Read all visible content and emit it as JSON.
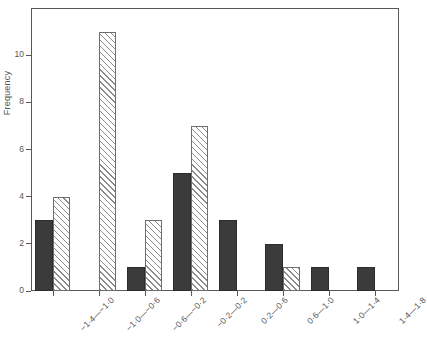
{
  "chart_data": {
    "type": "bar",
    "title": "",
    "subtitle": "",
    "xlabel": "",
    "ylabel": "Frequency",
    "grid": false,
    "legend": "none",
    "ylim": [
      0,
      12
    ],
    "yticks": [
      0,
      2,
      4,
      6,
      8,
      10
    ],
    "ytick_labels": [
      "0",
      "2",
      "4",
      "6",
      "8",
      "10"
    ],
    "categories": [
      "−1·4—−1·0",
      "−1·0—−0·6",
      "−0·6—−0·2",
      "−0·2—0·2",
      "0·2—0·6",
      "0·6—1·0",
      "1·0—1·4",
      "1·4—1·8"
    ],
    "series": [
      {
        "name": "solid",
        "fill": "solid-dark",
        "values": [
          3,
          0,
          1,
          5,
          3,
          2,
          1,
          1
        ]
      },
      {
        "name": "hatched",
        "fill": "diagonal-hatch",
        "values": [
          4,
          11,
          3,
          7,
          0,
          1,
          0,
          0
        ]
      }
    ],
    "colors": {
      "solid": "#3b3b3b",
      "hatch_line": "#8a8a8c",
      "hatch_background": "#ffffff",
      "axis": "#58585a",
      "text": "#555555"
    }
  }
}
